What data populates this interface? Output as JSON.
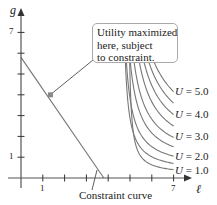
{
  "chart_data": {
    "type": "line",
    "title": "",
    "xlabel": "ℓ",
    "ylabel": "g",
    "xlim": [
      0,
      7.5
    ],
    "ylim": [
      0,
      7.5
    ],
    "x_ticks": [
      1,
      2,
      3,
      4,
      5,
      6,
      7
    ],
    "x_tick_labels": [
      "1",
      "",
      "",
      "",
      "",
      "",
      "7"
    ],
    "y_ticks": [
      1,
      2,
      3,
      4,
      5,
      6,
      7
    ],
    "y_tick_labels": [
      "1",
      "",
      "",
      "",
      "",
      "",
      "7"
    ],
    "grid": false,
    "series": [
      {
        "name": "U = 1.0",
        "label": "U = 1.0",
        "k": 0.55,
        "end_g": 0.4
      },
      {
        "name": "",
        "label": "",
        "k": 1.1,
        "end_g": 0.7
      },
      {
        "name": "U = 2.0",
        "label": "U = 2.0",
        "k": 1.7,
        "end_g": 1.05
      },
      {
        "name": "",
        "label": "",
        "k": 2.4,
        "end_g": 1.5
      },
      {
        "name": "U = 3.0",
        "label": "U = 3.0",
        "k": 3.1,
        "end_g": 1.95
      },
      {
        "name": "",
        "label": "",
        "k": 3.9,
        "end_g": 2.5
      },
      {
        "name": "U = 4.0",
        "label": "U = 4.0",
        "k": 4.8,
        "end_g": 3.05
      },
      {
        "name": "",
        "label": "",
        "k": 5.8,
        "end_g": 3.6
      },
      {
        "name": "U = 5.0",
        "label": "U = 5.0",
        "k": 7.0,
        "end_g": 4.15
      }
    ],
    "constraint_line": {
      "name": "Constraint curve",
      "g_intercept": 5.8,
      "l_intercept": 3.8
    },
    "optimum_point": {
      "l": 1.35,
      "g": 4.0
    },
    "annotations": [
      "Utility maximized here, subject to constraint.",
      "Constraint curve"
    ]
  },
  "labels": {
    "y_axis": "g",
    "x_axis": "ℓ",
    "y_tick_top": "7",
    "y_tick_bottom": "1",
    "x_tick_left": "1",
    "x_tick_right": "7",
    "callout_line1": "Utility maximized",
    "callout_line2": "here, subject",
    "callout_line3": "to constraint.",
    "constraint_label": "Constraint curve",
    "u_var": "U",
    "u5": " = 5.0",
    "u4": " = 4.0",
    "u3": " = 3.0",
    "u2": " = 2.0",
    "u1": " = 1.0"
  },
  "colors": {
    "curve": "#777777",
    "axis": "#555555",
    "marker": "#888888",
    "text": "#222222"
  }
}
